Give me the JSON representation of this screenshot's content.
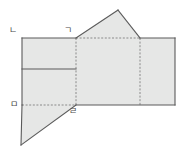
{
  "figure": {
    "kind": "geometry-net-diagram",
    "background_color": "#ffffff",
    "face_fill_color": "#e6e7e6",
    "solid_edge_color": "#5a5a5a",
    "fold_line_color": "#8a8a8a",
    "label_color": "#4a4a4a",
    "vertex_labels": [
      {
        "id": "label-n",
        "text": "ㄴ",
        "x": 9,
        "y": 26
      },
      {
        "id": "label-g",
        "text": "ㄱ",
        "x": 64,
        "y": 26
      },
      {
        "id": "label-m",
        "text": "ㅁ",
        "x": 10,
        "y": 100
      },
      {
        "id": "label-r",
        "text": "ㄹ",
        "x": 69,
        "y": 107
      }
    ],
    "faces": [
      {
        "name": "left-rectangle-face",
        "points": "22,38 76,38 76,105 22,105"
      },
      {
        "name": "center-rectangle-face",
        "points": "76,38 140,38 140,105 76,105"
      },
      {
        "name": "right-rectangle-face",
        "points": "140,38 175,38 175,105 140,105"
      },
      {
        "name": "top-triangle-face",
        "points": "76,38 118,10 140,38"
      },
      {
        "name": "bottom-left-triangle-face",
        "points": "22,105 76,105 21,145"
      }
    ],
    "solid_edges": [
      {
        "name": "outline-left-rect-top",
        "x1": 22,
        "y1": 38,
        "x2": 76,
        "y2": 38
      },
      {
        "name": "outline-left-rect-left",
        "x1": 22,
        "y1": 38,
        "x2": 22,
        "y2": 105
      },
      {
        "name": "outline-top-triangle-left",
        "x1": 76,
        "y1": 38,
        "x2": 118,
        "y2": 10
      },
      {
        "name": "outline-top-triangle-right",
        "x1": 118,
        "y1": 10,
        "x2": 140,
        "y2": 38
      },
      {
        "name": "outline-right-rect-top",
        "x1": 140,
        "y1": 38,
        "x2": 175,
        "y2": 38
      },
      {
        "name": "outline-right-rect-right",
        "x1": 175,
        "y1": 38,
        "x2": 175,
        "y2": 105
      },
      {
        "name": "outline-bottom-main",
        "x1": 175,
        "y1": 105,
        "x2": 76,
        "y2": 105
      },
      {
        "name": "outline-bottom-tri-hyp",
        "x1": 76,
        "y1": 105,
        "x2": 21,
        "y2": 145
      },
      {
        "name": "outline-bottom-tri-left",
        "x1": 21,
        "y1": 145,
        "x2": 22,
        "y2": 105
      },
      {
        "name": "inner-horizontal-divider",
        "x1": 22,
        "y1": 69,
        "x2": 76,
        "y2": 69
      }
    ],
    "fold_lines": [
      {
        "name": "fold-left-vertical",
        "x1": 76,
        "y1": 38,
        "x2": 76,
        "y2": 105
      },
      {
        "name": "fold-right-vertical",
        "x1": 140,
        "y1": 38,
        "x2": 140,
        "y2": 105
      },
      {
        "name": "fold-roof-base",
        "x1": 76,
        "y1": 38,
        "x2": 140,
        "y2": 38
      },
      {
        "name": "fold-bottom-left",
        "x1": 22,
        "y1": 105,
        "x2": 76,
        "y2": 105
      }
    ]
  }
}
